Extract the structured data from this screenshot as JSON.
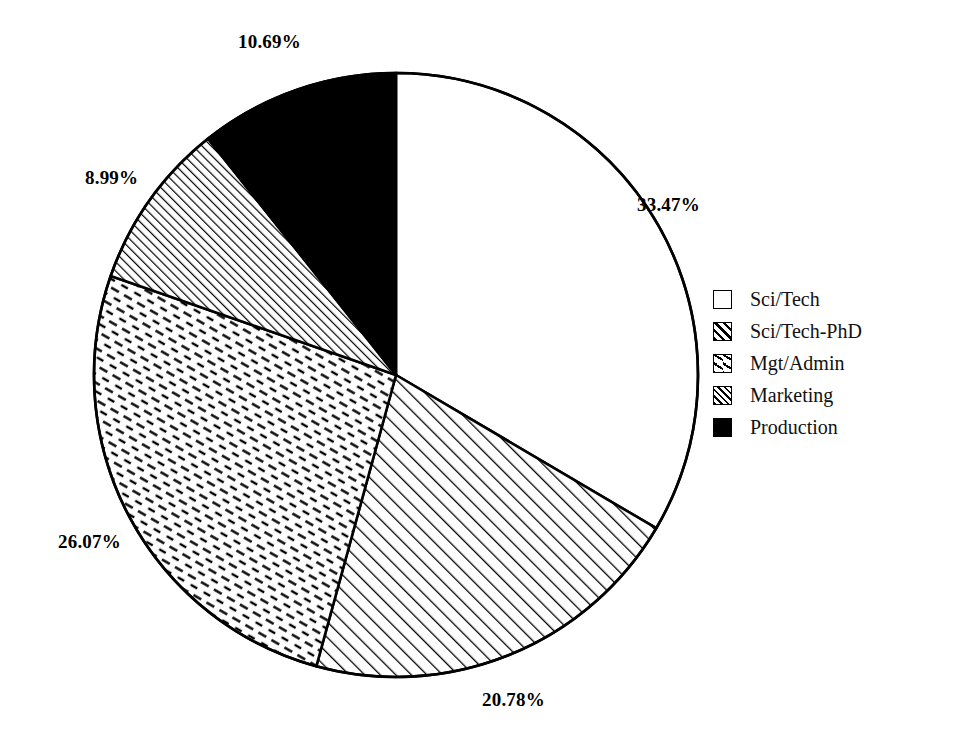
{
  "chart_data": {
    "type": "pie",
    "title": "",
    "subtitle": "",
    "xlabel": "",
    "ylabel": "",
    "grid": false,
    "legend_position": "right",
    "start_angle_deg": 90,
    "direction": "clockwise",
    "units": "percent",
    "categories": [
      "Sci/Tech",
      "Sci/Tech-PhD",
      "Mgt/Admin",
      "Marketing",
      "Production"
    ],
    "values": [
      33.47,
      20.78,
      26.07,
      8.99,
      10.69
    ],
    "labels": [
      "33.47%",
      "20.78%",
      "26.07%",
      "8.99%",
      "10.69%"
    ],
    "fills": [
      "solid-white",
      "diagonal-hatch",
      "dashed-diagonal-hatch",
      "dense-diagonal-hatch",
      "solid-black"
    ],
    "slices": [
      {
        "name": "Sci/Tech",
        "value": 33.47,
        "label": "33.47%",
        "fill": "solid-white",
        "color": "#ffffff"
      },
      {
        "name": "Sci/Tech-PhD",
        "value": 20.78,
        "label": "20.78%",
        "fill": "diagonal-hatch",
        "color": "#ffffff"
      },
      {
        "name": "Mgt/Admin",
        "value": 26.07,
        "label": "26.07%",
        "fill": "dashed-diagonal-hatch",
        "color": "#ffffff"
      },
      {
        "name": "Marketing",
        "value": 8.99,
        "label": "8.99%",
        "fill": "dense-diagonal-hatch",
        "color": "#ffffff"
      },
      {
        "name": "Production",
        "value": 10.69,
        "label": "10.69%",
        "fill": "solid-black",
        "color": "#000000"
      }
    ]
  },
  "labels": {
    "top": "10.69%",
    "right": "33.47%",
    "bottom": "20.78%",
    "lower_left": "26.07%",
    "upper_left": "8.99%"
  },
  "legend": {
    "items": [
      {
        "label": "Sci/Tech",
        "swatch": "solid-white-swatch"
      },
      {
        "label": "Sci/Tech-PhD",
        "swatch": "diagonal-hatch-swatch"
      },
      {
        "label": "Mgt/Admin",
        "swatch": "dashed-diagonal-swatch"
      },
      {
        "label": "Marketing",
        "swatch": "dense-diagonal-swatch"
      },
      {
        "label": "Production",
        "swatch": "solid-black-swatch"
      }
    ]
  },
  "style": {
    "stroke": "#000000",
    "background": "#ffffff"
  }
}
